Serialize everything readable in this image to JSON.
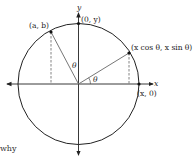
{
  "diagram": {
    "type": "unit-circle rotation figure",
    "axes": {
      "x_label": "x",
      "y_label": "y"
    },
    "points": [
      {
        "id": "a-b",
        "label": "(a, b)"
      },
      {
        "id": "zero-y",
        "label": "(0, y)"
      },
      {
        "id": "xcos-xsin",
        "label": "(x cos θ, x sin θ)"
      },
      {
        "id": "x-zero",
        "label": "(x, 0)"
      }
    ],
    "angle_labels": [
      "θ",
      "θ"
    ],
    "text_fragment": "why"
  }
}
